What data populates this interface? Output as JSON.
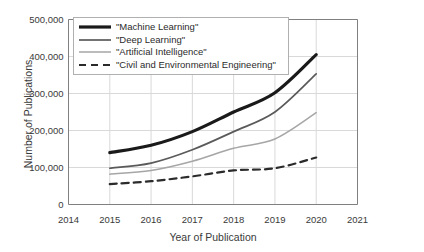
{
  "chart_data": {
    "type": "line",
    "title": "",
    "xlabel": "Year of Publication",
    "ylabel": "Number of Publications",
    "x": [
      2015,
      2016,
      2017,
      2018,
      2019,
      2020
    ],
    "xlim": [
      2014,
      2021
    ],
    "ylim": [
      0,
      500000
    ],
    "x_ticks": [
      "2014",
      "2015",
      "2016",
      "2017",
      "2018",
      "2019",
      "2020",
      "2021"
    ],
    "y_ticks": [
      "0",
      "100,000",
      "200,000",
      "300,000",
      "400,000",
      "500,000"
    ],
    "y_tick_values": [
      0,
      100000,
      200000,
      300000,
      400000,
      500000
    ],
    "grid": true,
    "grid_axis": "both",
    "legend_position": "top-left-inside",
    "series": [
      {
        "name": "\"Machine Learning\"",
        "values": [
          140000,
          160000,
          197000,
          250000,
          302000,
          405000
        ],
        "color": "#1a1a1a",
        "width": 3.2,
        "dash": "none",
        "icon": "thick-solid-line-icon"
      },
      {
        "name": "\"Deep Learning\"",
        "values": [
          98000,
          112000,
          148000,
          197000,
          250000,
          353000
        ],
        "color": "#5a5a5a",
        "width": 1.7,
        "dash": "none",
        "icon": "medium-solid-line-icon"
      },
      {
        "name": "\"Artificial Intelligence\"",
        "values": [
          82000,
          92000,
          117000,
          152000,
          177000,
          248000
        ],
        "color": "#a6a6a6",
        "width": 1.5,
        "dash": "none",
        "icon": "light-solid-line-icon"
      },
      {
        "name": "\"Civil and Environmental Engineering\"",
        "values": [
          55000,
          63000,
          76000,
          92000,
          98000,
          127000
        ],
        "color": "#2b2b2b",
        "width": 2.2,
        "dash": "7,5",
        "icon": "dashed-line-icon"
      }
    ]
  }
}
